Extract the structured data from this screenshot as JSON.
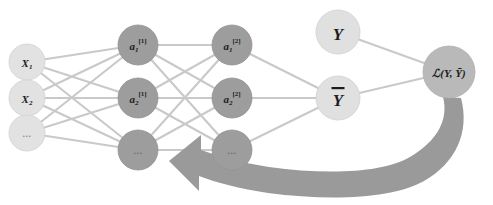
{
  "diagram": {
    "canvas": {
      "width": 493,
      "height": 205,
      "background": "#ffffff"
    },
    "colors": {
      "input_node": "#e2e2e2",
      "hidden_node": "#9d9d9d",
      "output_node": "#e0e0e0",
      "loss_node": "#b9b9b9",
      "edge": "#c9c9c9",
      "arrow": "#9a9a9a",
      "label_text": "#1c1c1c"
    },
    "layers": [
      {
        "name": "input-layer",
        "x": 27,
        "nodes": [
          {
            "id": "input-x1",
            "label": "X",
            "sub": "1",
            "sup": "",
            "y": 62,
            "r": 18,
            "style": "input",
            "is_dots": false
          },
          {
            "id": "input-x2",
            "label": "X",
            "sub": "2",
            "sup": "",
            "y": 98,
            "r": 18,
            "style": "input",
            "is_dots": false
          },
          {
            "id": "input-dots",
            "label": "...",
            "sub": "",
            "sup": "",
            "y": 133,
            "r": 18,
            "style": "input",
            "is_dots": true
          }
        ]
      },
      {
        "name": "hidden-layer-1",
        "x": 138,
        "nodes": [
          {
            "id": "hidden1-a1",
            "label": "a",
            "sub": "1",
            "sup": "[1]",
            "y": 45,
            "r": 20,
            "style": "hidden",
            "is_dots": false
          },
          {
            "id": "hidden1-a2",
            "label": "a",
            "sub": "2",
            "sup": "[1]",
            "y": 98,
            "r": 20,
            "style": "hidden",
            "is_dots": false
          },
          {
            "id": "hidden1-dots",
            "label": "...",
            "sub": "",
            "sup": "",
            "y": 150,
            "r": 20,
            "style": "hidden",
            "is_dots": true
          }
        ]
      },
      {
        "name": "hidden-layer-2",
        "x": 232,
        "nodes": [
          {
            "id": "hidden2-a1",
            "label": "a",
            "sub": "1",
            "sup": "[2]",
            "y": 45,
            "r": 20,
            "style": "hidden",
            "is_dots": false
          },
          {
            "id": "hidden2-a2",
            "label": "a",
            "sub": "2",
            "sup": "[2]",
            "y": 98,
            "r": 20,
            "style": "hidden",
            "is_dots": false
          },
          {
            "id": "hidden2-dots",
            "label": "...",
            "sub": "",
            "sup": "",
            "y": 150,
            "r": 20,
            "style": "hidden",
            "is_dots": true
          }
        ]
      },
      {
        "name": "output-layer",
        "x": 338,
        "nodes": [
          {
            "id": "output-y-true",
            "label": "Y",
            "sub": "",
            "sup": "",
            "y": 32,
            "r": 22,
            "style": "output",
            "is_dots": false,
            "overbar": false
          },
          {
            "id": "output-y-pred",
            "label": "Y",
            "sub": "",
            "sup": "",
            "y": 98,
            "r": 22,
            "style": "output",
            "is_dots": false,
            "overbar": true
          }
        ]
      },
      {
        "name": "loss-layer",
        "x": 449,
        "nodes": [
          {
            "id": "loss-node",
            "label": "ℒ(Y, Ȳ)",
            "sub": "",
            "sup": "",
            "y": 72,
            "r": 26,
            "style": "loss",
            "is_dots": false
          }
        ]
      }
    ],
    "edges": [
      {
        "from": "input-x1",
        "to": "hidden1-a1"
      },
      {
        "from": "input-x1",
        "to": "hidden1-a2"
      },
      {
        "from": "input-x1",
        "to": "hidden1-dots"
      },
      {
        "from": "input-x2",
        "to": "hidden1-a1"
      },
      {
        "from": "input-x2",
        "to": "hidden1-a2"
      },
      {
        "from": "input-x2",
        "to": "hidden1-dots"
      },
      {
        "from": "input-dots",
        "to": "hidden1-a1"
      },
      {
        "from": "input-dots",
        "to": "hidden1-a2"
      },
      {
        "from": "input-dots",
        "to": "hidden1-dots"
      },
      {
        "from": "hidden1-a1",
        "to": "hidden2-a1"
      },
      {
        "from": "hidden1-a1",
        "to": "hidden2-a2"
      },
      {
        "from": "hidden1-a1",
        "to": "hidden2-dots"
      },
      {
        "from": "hidden1-a2",
        "to": "hidden2-a1"
      },
      {
        "from": "hidden1-a2",
        "to": "hidden2-a2"
      },
      {
        "from": "hidden1-a2",
        "to": "hidden2-dots"
      },
      {
        "from": "hidden1-dots",
        "to": "hidden2-a1"
      },
      {
        "from": "hidden1-dots",
        "to": "hidden2-a2"
      },
      {
        "from": "hidden1-dots",
        "to": "hidden2-dots"
      },
      {
        "from": "hidden2-a1",
        "to": "output-y-pred"
      },
      {
        "from": "hidden2-a2",
        "to": "output-y-pred"
      },
      {
        "from": "hidden2-dots",
        "to": "output-y-pred"
      },
      {
        "from": "output-y-true",
        "to": "loss-node"
      },
      {
        "from": "output-y-pred",
        "to": "loss-node"
      }
    ],
    "backprop_arrow": {
      "name": "backpropagation-arrow",
      "direction": "right-to-left",
      "from_node": "loss-node",
      "to_node": "hidden1-dots",
      "color": "#9a9a9a"
    }
  }
}
